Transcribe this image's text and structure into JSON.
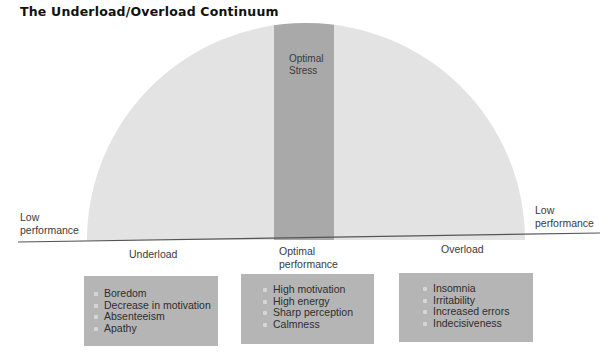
{
  "title": "The Underload/Overload Continuum",
  "diagram": {
    "optimal_band_label": [
      "Optimal",
      "Stress"
    ],
    "left_end_label": [
      "Low",
      "performance"
    ],
    "right_end_label": [
      "Low",
      "performance"
    ],
    "axis_labels": {
      "underload": "Underload",
      "optimal": [
        "Optimal",
        "performance"
      ],
      "overload": "Overload"
    },
    "colors": {
      "arc_fill": "#e3e3e3",
      "optimal_band": "#a9a9a9",
      "box_fill": "#b5b5b5",
      "baseline": "#555555"
    }
  },
  "boxes": [
    {
      "name": "underload",
      "items": [
        "Boredom",
        "Decrease in motivation",
        "Absenteeism",
        "Apathy"
      ]
    },
    {
      "name": "optimal",
      "items": [
        "High motivation",
        "High energy",
        "Sharp perception",
        "Calmness"
      ]
    },
    {
      "name": "overload",
      "items": [
        "Insomnia",
        "Irritability",
        "Increased errors",
        "Indecisiveness"
      ]
    }
  ]
}
